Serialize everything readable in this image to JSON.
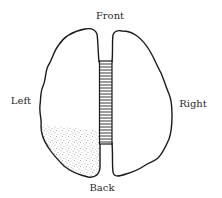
{
  "diagram": {
    "labels": {
      "front": "Front",
      "left": "Left",
      "right": "Right",
      "back": "Back"
    },
    "regions": [
      {
        "name": "left-hemisphere",
        "shaded": false
      },
      {
        "name": "right-hemisphere",
        "shaded": false
      },
      {
        "name": "corpus-callosum",
        "pattern": "horizontal-hatching"
      },
      {
        "name": "left-posterior-region",
        "pattern": "stippled",
        "location": "lower-left of left hemisphere"
      }
    ],
    "colors": {
      "stroke": "#1a1a1a",
      "background": "#ffffff",
      "stipple": "#555555"
    }
  }
}
